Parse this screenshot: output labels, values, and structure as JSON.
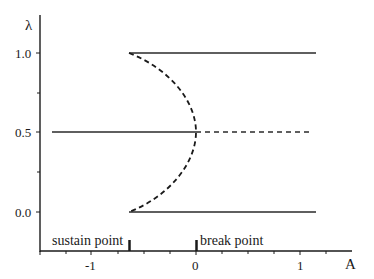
{
  "diagram": {
    "y_axis": {
      "label": "λ",
      "ticks": [
        {
          "value": 1.0,
          "label": "1.0"
        },
        {
          "value": 0.75,
          "label": ""
        },
        {
          "value": 0.5,
          "label": "0.5"
        },
        {
          "value": 0.25,
          "label": ""
        },
        {
          "value": 0.0,
          "label": "0.0"
        }
      ]
    },
    "x_axis": {
      "label": "A",
      "ticks": [
        {
          "value": -1,
          "label": "-1"
        },
        {
          "value": 0,
          "label": "0"
        },
        {
          "value": 1,
          "label": "1"
        }
      ]
    },
    "annotations": {
      "sustain_point": "sustain point",
      "break_point": "break point"
    },
    "branches": [
      {
        "name": "upper stable branch",
        "style": "solid",
        "lambda": 1.0,
        "A_from": -0.64,
        "A_to": 1.15
      },
      {
        "name": "lower stable branch",
        "style": "solid",
        "lambda": 0.0,
        "A_from": -0.64,
        "A_to": 1.15
      },
      {
        "name": "middle branch stable",
        "style": "solid",
        "lambda": 0.5,
        "A_from": -1.38,
        "A_to": 0
      },
      {
        "name": "middle branch unstable",
        "style": "dashed",
        "lambda": 0.5,
        "A_from": 0,
        "A_to": 1.12
      },
      {
        "name": "unstable fold curve",
        "style": "dashed",
        "from": [
          -0.64,
          1.0
        ],
        "through": [
          0,
          0.5
        ],
        "to": [
          -0.64,
          0.0
        ]
      }
    ]
  }
}
